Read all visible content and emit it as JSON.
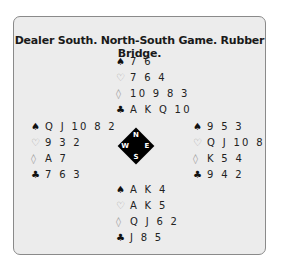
{
  "title": "Dealer South. North-South Game. Rubber Bridge.",
  "suit_symbols": {
    "spades": "♠",
    "hearts": "♡",
    "diamonds": "◊",
    "clubs": "♣"
  },
  "hands": {
    "north": {
      "spades": "7 6",
      "hearts": "7 6 4",
      "diamonds": "10 9 8 3",
      "clubs": "A K Q 10"
    },
    "west": {
      "spades": "Q J 10 8 2",
      "hearts": "9 3 2",
      "diamonds": "A 7",
      "clubs": "7 6 3"
    },
    "east": {
      "spades": "9 5 3",
      "hearts": "Q J 10 8",
      "diamonds": "K 5 4",
      "clubs": "9 4 2"
    },
    "south": {
      "spades": "A K 4",
      "hearts": "A K 5",
      "diamonds": "Q J 6 2",
      "clubs": "J 8 5"
    }
  },
  "compass": {
    "n": "N",
    "s": "S",
    "w": "W",
    "e": "E"
  }
}
